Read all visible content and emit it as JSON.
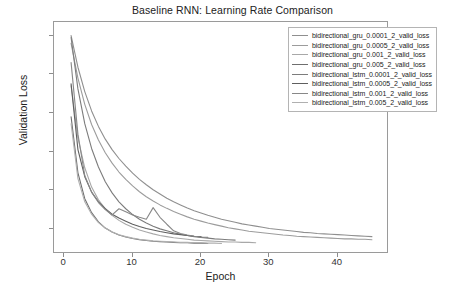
{
  "chart_data": {
    "type": "line",
    "title": "Baseline RNN: Learning Rate Comparison",
    "xlabel": "Epoch",
    "ylabel": "Validation Loss",
    "xlim": [
      -1.5,
      47.5
    ],
    "ylim": [
      1.35,
      7.35
    ],
    "xticks": [
      0,
      10,
      20,
      30,
      40
    ],
    "yticks": [
      2,
      3,
      4,
      5,
      6,
      7
    ],
    "grid": false,
    "legend_position": "upper right",
    "series": [
      {
        "name": "bidirectional_gru_0.0001_2_valid_loss",
        "color": "#8f8f8f",
        "x": [
          1,
          2,
          3,
          4,
          5,
          6,
          7,
          8,
          9,
          10,
          11,
          12,
          13,
          14,
          15,
          16,
          17,
          18,
          19,
          20,
          21,
          22,
          23,
          24,
          25,
          26,
          27,
          28,
          29,
          30,
          31,
          32,
          33,
          34,
          35,
          36,
          37,
          38,
          39,
          40,
          41,
          42,
          43,
          44,
          45
        ],
        "y": [
          7.0,
          6.18,
          5.55,
          5.05,
          4.65,
          4.32,
          4.05,
          3.82,
          3.62,
          3.44,
          3.28,
          3.14,
          3.01,
          2.9,
          2.79,
          2.7,
          2.62,
          2.54,
          2.47,
          2.41,
          2.35,
          2.3,
          2.25,
          2.21,
          2.17,
          2.13,
          2.1,
          2.07,
          2.04,
          2.01,
          1.99,
          1.97,
          1.95,
          1.93,
          1.91,
          1.9,
          1.88,
          1.87,
          1.86,
          1.85,
          1.84,
          1.83,
          1.82,
          1.81,
          1.8
        ]
      },
      {
        "name": "bidirectional_gru_0.0005_2_valid_loss",
        "color": "#9c9c9c",
        "x": [
          1,
          2,
          3,
          4,
          5,
          6,
          7,
          8,
          9,
          10,
          11,
          12,
          13,
          14,
          15,
          16,
          17,
          18,
          19,
          20,
          21,
          22,
          23,
          24,
          25,
          26,
          27,
          28,
          29,
          30,
          31,
          32,
          33,
          34,
          35,
          36,
          37,
          38,
          39,
          40,
          41,
          42,
          43,
          44,
          45
        ],
        "y": [
          6.8,
          5.9,
          5.22,
          4.7,
          4.3,
          3.97,
          3.7,
          3.47,
          3.28,
          3.11,
          2.96,
          2.83,
          2.72,
          2.62,
          2.53,
          2.45,
          2.38,
          2.31,
          2.25,
          2.2,
          2.15,
          2.11,
          2.07,
          2.03,
          2.0,
          1.97,
          1.94,
          1.92,
          1.9,
          1.88,
          1.86,
          1.84,
          1.83,
          1.81,
          1.8,
          1.79,
          1.78,
          1.77,
          1.76,
          1.75,
          1.74,
          1.74,
          1.73,
          1.73,
          1.72
        ]
      },
      {
        "name": "bidirectional_gru_0.001_2_valid_loss",
        "color": "#a8a8a8",
        "x": [
          1,
          2,
          3,
          4,
          5,
          6,
          7,
          8,
          9,
          10,
          11,
          12,
          13,
          14,
          15,
          16,
          17,
          18,
          19,
          20,
          21,
          22,
          23,
          24,
          25,
          26,
          27,
          28
        ],
        "y": [
          5.7,
          4.35,
          3.58,
          3.08,
          2.75,
          2.52,
          2.35,
          2.22,
          2.12,
          2.04,
          1.97,
          1.92,
          1.87,
          1.83,
          1.8,
          1.77,
          1.75,
          1.73,
          1.71,
          1.7,
          1.69,
          1.68,
          1.67,
          1.66,
          1.66,
          1.65,
          1.65,
          1.64
        ]
      },
      {
        "name": "bidirectional_gru_0.005_2_valid_loss",
        "color": "#6e6e6e",
        "x": [
          1,
          2,
          3,
          4,
          5,
          6,
          7,
          8,
          9,
          10,
          11,
          12,
          13,
          14,
          15,
          16,
          17,
          18,
          19,
          20,
          21
        ],
        "y": [
          4.9,
          3.45,
          2.78,
          2.42,
          2.18,
          2.02,
          1.92,
          1.84,
          1.79,
          1.75,
          1.72,
          1.7,
          1.68,
          1.67,
          1.66,
          1.65,
          1.64,
          1.64,
          1.63,
          1.63,
          1.62
        ]
      },
      {
        "name": "bidirectional_lstm_0.0001_2_valid_loss",
        "color": "#7c7c7c",
        "x": [
          1,
          2,
          3,
          4,
          5,
          6,
          7,
          8,
          9,
          10,
          11,
          12,
          13,
          14,
          15,
          16,
          17,
          18,
          19,
          20,
          21,
          22,
          23,
          24,
          25
        ],
        "y": [
          6.95,
          5.62,
          4.72,
          4.08,
          3.6,
          3.22,
          2.93,
          2.7,
          2.52,
          2.37,
          2.25,
          2.15,
          2.07,
          2.0,
          1.95,
          1.9,
          1.86,
          1.83,
          1.8,
          1.78,
          1.76,
          1.74,
          1.73,
          1.72,
          1.71
        ]
      },
      {
        "name": "bidirectional_lstm_0.0005_2_valid_loss",
        "color": "#5f5f5f",
        "x": [
          1,
          2,
          3,
          4,
          5,
          6,
          7,
          8,
          9,
          10,
          11,
          12,
          13,
          14,
          15,
          16,
          17,
          18,
          19,
          20
        ],
        "y": [
          5.75,
          4.05,
          3.35,
          2.95,
          2.7,
          2.52,
          2.38,
          2.28,
          2.2,
          2.12,
          2.06,
          2.01,
          1.97,
          1.93,
          1.9,
          1.87,
          1.85,
          1.83,
          1.81,
          1.8
        ]
      },
      {
        "name": "bidirectional_lstm_0.001_2_valid_loss",
        "color": "#888888",
        "x": [
          1,
          2,
          3,
          4,
          5,
          6,
          7,
          8,
          9,
          10,
          11,
          12,
          13,
          14,
          15,
          16,
          17,
          18,
          19,
          20,
          21
        ],
        "y": [
          6.3,
          4.45,
          3.38,
          2.95,
          2.68,
          2.5,
          2.36,
          2.52,
          2.44,
          2.36,
          2.3,
          2.25,
          2.55,
          2.3,
          2.12,
          1.95,
          1.88,
          1.84,
          1.81,
          1.79,
          1.78
        ]
      },
      {
        "name": "bidirectional_lstm_0.005_2_valid_loss",
        "color": "#b0b0b0",
        "x": [
          1,
          2,
          3,
          4,
          5,
          6,
          7,
          8,
          9,
          10,
          11,
          12,
          13,
          14,
          15,
          16,
          17,
          18,
          19,
          20,
          21,
          22,
          23
        ],
        "y": [
          4.72,
          3.3,
          2.7,
          2.38,
          2.16,
          2.02,
          1.92,
          1.85,
          1.8,
          1.76,
          1.73,
          1.71,
          1.69,
          1.68,
          1.67,
          1.66,
          1.65,
          1.65,
          1.64,
          1.64,
          1.63,
          1.63,
          1.62
        ]
      }
    ]
  }
}
